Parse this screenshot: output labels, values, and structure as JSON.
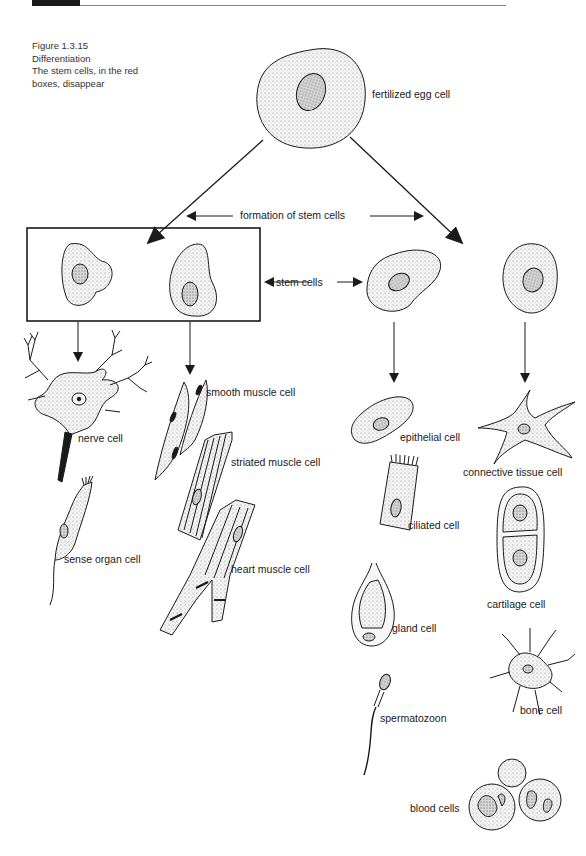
{
  "header": {
    "text_visible": false
  },
  "caption": {
    "figure_number": "Figure 1.3.15",
    "title": "Differentiation",
    "line1": "The stem cells, in the red",
    "line2": "boxes, disappear"
  },
  "labels": {
    "fertilized_egg": "fertilized egg cell",
    "formation": "formation of stem cells",
    "stem_cells": "stem cells",
    "nerve": "nerve cell",
    "sense_organ": "sense organ cell",
    "smooth_muscle": "smooth muscle cell",
    "striated_muscle": "striated muscle cell",
    "heart_muscle": "heart muscle cell",
    "epithelial": "epithelial cell",
    "ciliated": "ciliated cell",
    "gland": "gland cell",
    "spermatozoon": "spermatozoon",
    "connective_tissue": "connective tissue cell",
    "cartilage": "cartilage cell",
    "bone": "bone cell",
    "blood": "blood cells"
  },
  "colors": {
    "ink": "#1a1a1a",
    "cell_fill": "#ececec",
    "nucleus_fill": "#bdbdbd"
  }
}
